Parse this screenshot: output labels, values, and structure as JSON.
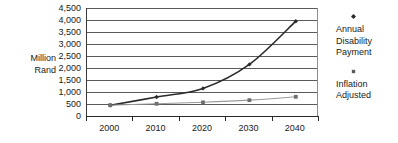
{
  "chart_data": {
    "type": "line",
    "title": "",
    "xlabel": "",
    "ylabel": "Million Rand",
    "ylabel_lines": [
      "Million",
      "Rand"
    ],
    "categories": [
      "2000",
      "2010",
      "2020",
      "2030",
      "2040"
    ],
    "x": [
      2000,
      2010,
      2020,
      2030,
      2040
    ],
    "ylim": [
      0,
      4500
    ],
    "y_ticks": [
      0,
      500,
      1000,
      1500,
      2000,
      2500,
      3000,
      3500,
      4000,
      4500
    ],
    "y_tick_labels": [
      "0",
      "500",
      "1,000",
      "1,500",
      "2,000",
      "2,500",
      "3,000",
      "3,500",
      "4,000",
      "4,500"
    ],
    "grid": "horizontal",
    "legend_position": "right",
    "series": [
      {
        "name": "Annual Disability Payment",
        "name_lines": [
          "Annual",
          "Disability",
          "Payment"
        ],
        "color": "#2b2b2b",
        "marker": "diamond",
        "values": [
          450,
          790,
          1150,
          2150,
          3950
        ]
      },
      {
        "name": "Inflation Adjusted",
        "name_lines": [
          "Inflation",
          "Adjusted"
        ],
        "color": "#9a9a9a",
        "marker": "square",
        "values": [
          450,
          510,
          570,
          660,
          800
        ]
      }
    ]
  },
  "legend": {
    "entries": [
      {
        "label_line1": "Annual",
        "label_line2": "Disability",
        "label_line3": "Payment"
      },
      {
        "label_line1": "Inflation",
        "label_line2": "Adjusted",
        "label_line3": ""
      }
    ]
  },
  "axis": {
    "y_title_line1": "Million",
    "y_title_line2": "Rand"
  },
  "colors": {
    "series1": "#2b2b2b",
    "series2": "#9a9a9a",
    "gridline": "#5a5a5a",
    "axis": "#2a2a2a",
    "text": "#1a1a1a",
    "background": "#ffffff"
  }
}
